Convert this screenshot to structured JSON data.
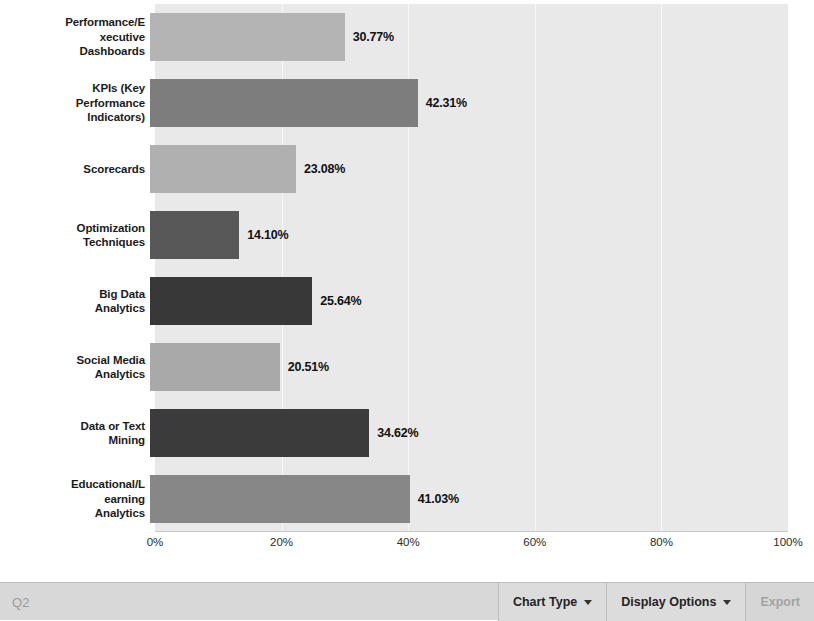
{
  "chart_data": {
    "type": "bar",
    "orientation": "horizontal",
    "title": "",
    "xlabel": "",
    "ylabel": "",
    "xlim": [
      0,
      100
    ],
    "xticks": [
      "0%",
      "20%",
      "40%",
      "60%",
      "80%",
      "100%"
    ],
    "xtick_values": [
      0,
      20,
      40,
      60,
      80,
      100
    ],
    "grid": true,
    "legend": false,
    "categories": [
      "Performance/Executive Dashboards",
      "KPIs (Key Performance Indicators)",
      "Scorecards",
      "Optimization Techniques",
      "Big Data Analytics",
      "Social Media Analytics",
      "Data or Text Mining",
      "Educational/Learning Analytics"
    ],
    "values": [
      30.77,
      42.31,
      23.08,
      14.1,
      25.64,
      20.51,
      34.62,
      41.03
    ],
    "value_labels": [
      "30.77%",
      "42.31%",
      "23.08%",
      "14.10%",
      "25.64%",
      "20.51%",
      "34.62%",
      "41.03%"
    ],
    "bar_colors": [
      "#b4b4b4",
      "#7d7d7d",
      "#b0b0b0",
      "#585858",
      "#383838",
      "#a9a9a9",
      "#3b3b3b",
      "#878787"
    ],
    "plot_background": "#e9e9e9",
    "gridline_color": "#f7f7f7"
  },
  "chart": {
    "rows": [
      {
        "label_lines": [
          "Performance/E",
          "xecutive",
          "Dashboards"
        ],
        "value": "30.77%"
      },
      {
        "label_lines": [
          "KPIs (Key",
          "Performance",
          "Indicators)"
        ],
        "value": "42.31%"
      },
      {
        "label_lines": [
          "Scorecards"
        ],
        "value": "23.08%"
      },
      {
        "label_lines": [
          "Optimization",
          "Techniques"
        ],
        "value": "14.10%"
      },
      {
        "label_lines": [
          "Big Data",
          "Analytics"
        ],
        "value": "25.64%"
      },
      {
        "label_lines": [
          "Social Media",
          "Analytics"
        ],
        "value": "20.51%"
      },
      {
        "label_lines": [
          "Data or Text",
          "Mining"
        ],
        "value": "34.62%"
      },
      {
        "label_lines": [
          "Educational/L",
          "earning",
          "Analytics"
        ],
        "value": "41.03%"
      }
    ]
  },
  "toolbar": {
    "title": "Q2",
    "chart_type_label": "Chart Type",
    "display_options_label": "Display Options",
    "export_label": "Export"
  }
}
